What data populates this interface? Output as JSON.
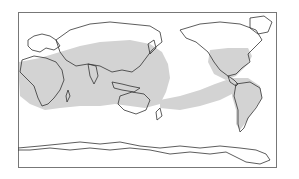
{
  "map": {
    "type": "world-map",
    "projection": "equirectangular",
    "center_longitude": "roughly 150E (Europe/Africa at left, Americas at right)",
    "shaded_region_color": "#d3d3d3",
    "land_outline_color": "#333333",
    "frame_color": "#777777",
    "background_color": "#ffffff",
    "shaded_region_description": "Tropical/subtropical band spanning Africa, southern Asia, Indian Ocean, Maritime Continent, Australia, central/eastern Pacific, and the Americas"
  }
}
